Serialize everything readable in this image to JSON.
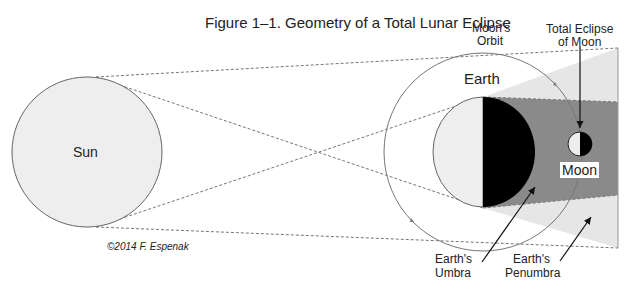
{
  "title": "Figure 1–1. Geometry of a Total Lunar Eclipse",
  "labels": {
    "sun": "Sun",
    "earth": "Earth",
    "moon": "Moon",
    "moons_orbit_line1": "Moon's",
    "moons_orbit_line2": "Orbit",
    "total_eclipse_line1": "Total Eclipse",
    "total_eclipse_line2": "of Moon",
    "umbra_line1": "Earth's",
    "umbra_line2": "Umbra",
    "penumbra_line1": "Earth's",
    "penumbra_line2": "Penumbra"
  },
  "credit": "©2014 F. Espenak",
  "colors": {
    "sun_fill": "#eeeeee",
    "penumbra_fill": "#e6e6e6",
    "umbra_fill": "#8a8a8a",
    "night_side": "#000000",
    "outline": "#777777"
  }
}
